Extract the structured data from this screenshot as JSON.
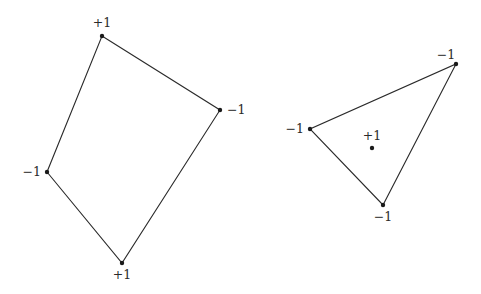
{
  "figures": [
    {
      "name": "quadrilateral",
      "vertices": [
        {
          "x": 102,
          "y": 36,
          "label": "+1",
          "lx": 102,
          "ly": 27,
          "anchor": "middle"
        },
        {
          "x": 220,
          "y": 110,
          "label": "−1",
          "lx": 227,
          "ly": 114,
          "anchor": "start"
        },
        {
          "x": 122,
          "y": 263,
          "label": "+1",
          "lx": 122,
          "ly": 279,
          "anchor": "middle"
        },
        {
          "x": 47,
          "y": 172,
          "label": "−1",
          "lx": 41,
          "ly": 176,
          "anchor": "end"
        }
      ],
      "closed": true
    },
    {
      "name": "triangle",
      "vertices": [
        {
          "x": 456,
          "y": 64,
          "label": "−1",
          "lx": 446,
          "ly": 59,
          "anchor": "middle"
        },
        {
          "x": 383,
          "y": 205,
          "label": "−1",
          "lx": 383,
          "ly": 221,
          "anchor": "middle"
        },
        {
          "x": 310,
          "y": 129,
          "label": "−1",
          "lx": 304,
          "ly": 133,
          "anchor": "end"
        }
      ],
      "closed": true
    }
  ],
  "interior_points": [
    {
      "x": 372,
      "y": 148,
      "label": "+1",
      "lx": 372,
      "ly": 140,
      "anchor": "middle"
    }
  ],
  "colors": {
    "stroke": "#2a2a2a",
    "vertex": "#1a1a1a",
    "background": "#ffffff"
  }
}
